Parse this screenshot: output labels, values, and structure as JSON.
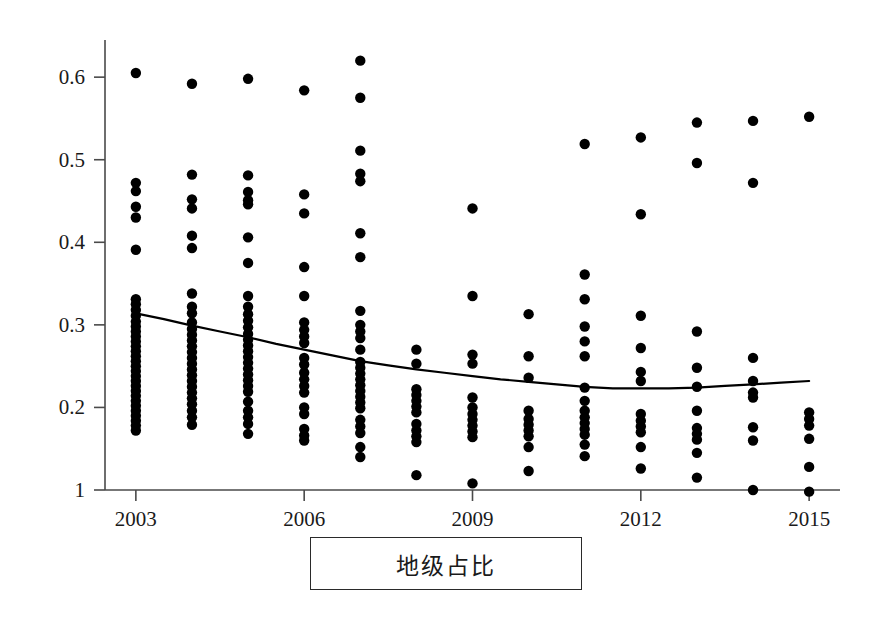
{
  "caption": {
    "label": "地级占比"
  },
  "style": {
    "point_color": "#000000",
    "line_color": "#000000",
    "axis_color": "#4a4a4a",
    "background": "#ffffff",
    "point_radius": 5.2,
    "line_width": 2.2,
    "axis_width": 1.6
  },
  "chart_data": {
    "type": "scatter",
    "title": "",
    "subtitle": "",
    "xlabel": "",
    "ylabel": "",
    "legend": [],
    "grid": false,
    "xlim": [
      2002.45,
      2015.55
    ],
    "ylim": [
      0.1,
      0.645
    ],
    "xticks": [
      2003,
      2006,
      2009,
      2012,
      2015
    ],
    "xticklabels": [
      "2003",
      "2006",
      "2009",
      "2012",
      "2015"
    ],
    "yticks": [
      0.1,
      0.2,
      0.3,
      0.4,
      0.5,
      0.6
    ],
    "yticklabels": [
      "1",
      "0.2",
      "0.3",
      "0.4",
      "0.5",
      "0.6"
    ],
    "series": [
      {
        "name": "地级占比",
        "type": "scatter",
        "marker": "filled-circle",
        "color": "#000000",
        "points": [
          {
            "x": 2003,
            "y": 0.605
          },
          {
            "x": 2003,
            "y": 0.472
          },
          {
            "x": 2003,
            "y": 0.462
          },
          {
            "x": 2003,
            "y": 0.443
          },
          {
            "x": 2003,
            "y": 0.43
          },
          {
            "x": 2003,
            "y": 0.391
          },
          {
            "x": 2003,
            "y": 0.331
          },
          {
            "x": 2003,
            "y": 0.325
          },
          {
            "x": 2003,
            "y": 0.318
          },
          {
            "x": 2003,
            "y": 0.311
          },
          {
            "x": 2003,
            "y": 0.304
          },
          {
            "x": 2003,
            "y": 0.298
          },
          {
            "x": 2003,
            "y": 0.292
          },
          {
            "x": 2003,
            "y": 0.286
          },
          {
            "x": 2003,
            "y": 0.28
          },
          {
            "x": 2003,
            "y": 0.274
          },
          {
            "x": 2003,
            "y": 0.268
          },
          {
            "x": 2003,
            "y": 0.262
          },
          {
            "x": 2003,
            "y": 0.256
          },
          {
            "x": 2003,
            "y": 0.25
          },
          {
            "x": 2003,
            "y": 0.244
          },
          {
            "x": 2003,
            "y": 0.238
          },
          {
            "x": 2003,
            "y": 0.232
          },
          {
            "x": 2003,
            "y": 0.226
          },
          {
            "x": 2003,
            "y": 0.22
          },
          {
            "x": 2003,
            "y": 0.214
          },
          {
            "x": 2003,
            "y": 0.208
          },
          {
            "x": 2003,
            "y": 0.202
          },
          {
            "x": 2003,
            "y": 0.196
          },
          {
            "x": 2003,
            "y": 0.19
          },
          {
            "x": 2003,
            "y": 0.184
          },
          {
            "x": 2003,
            "y": 0.178
          },
          {
            "x": 2003,
            "y": 0.172
          },
          {
            "x": 2004,
            "y": 0.592
          },
          {
            "x": 2004,
            "y": 0.482
          },
          {
            "x": 2004,
            "y": 0.452
          },
          {
            "x": 2004,
            "y": 0.441
          },
          {
            "x": 2004,
            "y": 0.408
          },
          {
            "x": 2004,
            "y": 0.393
          },
          {
            "x": 2004,
            "y": 0.338
          },
          {
            "x": 2004,
            "y": 0.322
          },
          {
            "x": 2004,
            "y": 0.314
          },
          {
            "x": 2004,
            "y": 0.303
          },
          {
            "x": 2004,
            "y": 0.295
          },
          {
            "x": 2004,
            "y": 0.288
          },
          {
            "x": 2004,
            "y": 0.281
          },
          {
            "x": 2004,
            "y": 0.274
          },
          {
            "x": 2004,
            "y": 0.267
          },
          {
            "x": 2004,
            "y": 0.26
          },
          {
            "x": 2004,
            "y": 0.253
          },
          {
            "x": 2004,
            "y": 0.246
          },
          {
            "x": 2004,
            "y": 0.239
          },
          {
            "x": 2004,
            "y": 0.232
          },
          {
            "x": 2004,
            "y": 0.225
          },
          {
            "x": 2004,
            "y": 0.218
          },
          {
            "x": 2004,
            "y": 0.211
          },
          {
            "x": 2004,
            "y": 0.204
          },
          {
            "x": 2004,
            "y": 0.196
          },
          {
            "x": 2004,
            "y": 0.188
          },
          {
            "x": 2004,
            "y": 0.179
          },
          {
            "x": 2005,
            "y": 0.598
          },
          {
            "x": 2005,
            "y": 0.481
          },
          {
            "x": 2005,
            "y": 0.461
          },
          {
            "x": 2005,
            "y": 0.451
          },
          {
            "x": 2005,
            "y": 0.446
          },
          {
            "x": 2005,
            "y": 0.406
          },
          {
            "x": 2005,
            "y": 0.375
          },
          {
            "x": 2005,
            "y": 0.335
          },
          {
            "x": 2005,
            "y": 0.322
          },
          {
            "x": 2005,
            "y": 0.313
          },
          {
            "x": 2005,
            "y": 0.305
          },
          {
            "x": 2005,
            "y": 0.297
          },
          {
            "x": 2005,
            "y": 0.289
          },
          {
            "x": 2005,
            "y": 0.282
          },
          {
            "x": 2005,
            "y": 0.275
          },
          {
            "x": 2005,
            "y": 0.268
          },
          {
            "x": 2005,
            "y": 0.261
          },
          {
            "x": 2005,
            "y": 0.254
          },
          {
            "x": 2005,
            "y": 0.247
          },
          {
            "x": 2005,
            "y": 0.24
          },
          {
            "x": 2005,
            "y": 0.233
          },
          {
            "x": 2005,
            "y": 0.226
          },
          {
            "x": 2005,
            "y": 0.219
          },
          {
            "x": 2005,
            "y": 0.207
          },
          {
            "x": 2005,
            "y": 0.196
          },
          {
            "x": 2005,
            "y": 0.188
          },
          {
            "x": 2005,
            "y": 0.18
          },
          {
            "x": 2005,
            "y": 0.168
          },
          {
            "x": 2006,
            "y": 0.584
          },
          {
            "x": 2006,
            "y": 0.458
          },
          {
            "x": 2006,
            "y": 0.435
          },
          {
            "x": 2006,
            "y": 0.37
          },
          {
            "x": 2006,
            "y": 0.335
          },
          {
            "x": 2006,
            "y": 0.303
          },
          {
            "x": 2006,
            "y": 0.294
          },
          {
            "x": 2006,
            "y": 0.286
          },
          {
            "x": 2006,
            "y": 0.278
          },
          {
            "x": 2006,
            "y": 0.26
          },
          {
            "x": 2006,
            "y": 0.252
          },
          {
            "x": 2006,
            "y": 0.242
          },
          {
            "x": 2006,
            "y": 0.234
          },
          {
            "x": 2006,
            "y": 0.226
          },
          {
            "x": 2006,
            "y": 0.218
          },
          {
            "x": 2006,
            "y": 0.2
          },
          {
            "x": 2006,
            "y": 0.192
          },
          {
            "x": 2006,
            "y": 0.174
          },
          {
            "x": 2006,
            "y": 0.166
          },
          {
            "x": 2006,
            "y": 0.16
          },
          {
            "x": 2007,
            "y": 0.62
          },
          {
            "x": 2007,
            "y": 0.575
          },
          {
            "x": 2007,
            "y": 0.511
          },
          {
            "x": 2007,
            "y": 0.483
          },
          {
            "x": 2007,
            "y": 0.474
          },
          {
            "x": 2007,
            "y": 0.411
          },
          {
            "x": 2007,
            "y": 0.382
          },
          {
            "x": 2007,
            "y": 0.317
          },
          {
            "x": 2007,
            "y": 0.3
          },
          {
            "x": 2007,
            "y": 0.292
          },
          {
            "x": 2007,
            "y": 0.284
          },
          {
            "x": 2007,
            "y": 0.27
          },
          {
            "x": 2007,
            "y": 0.255
          },
          {
            "x": 2007,
            "y": 0.248
          },
          {
            "x": 2007,
            "y": 0.241
          },
          {
            "x": 2007,
            "y": 0.234
          },
          {
            "x": 2007,
            "y": 0.227
          },
          {
            "x": 2007,
            "y": 0.22
          },
          {
            "x": 2007,
            "y": 0.213
          },
          {
            "x": 2007,
            "y": 0.206
          },
          {
            "x": 2007,
            "y": 0.199
          },
          {
            "x": 2007,
            "y": 0.185
          },
          {
            "x": 2007,
            "y": 0.177
          },
          {
            "x": 2007,
            "y": 0.169
          },
          {
            "x": 2007,
            "y": 0.152
          },
          {
            "x": 2007,
            "y": 0.14
          },
          {
            "x": 2008,
            "y": 0.27
          },
          {
            "x": 2008,
            "y": 0.253
          },
          {
            "x": 2008,
            "y": 0.222
          },
          {
            "x": 2008,
            "y": 0.215
          },
          {
            "x": 2008,
            "y": 0.208
          },
          {
            "x": 2008,
            "y": 0.201
          },
          {
            "x": 2008,
            "y": 0.194
          },
          {
            "x": 2008,
            "y": 0.18
          },
          {
            "x": 2008,
            "y": 0.172
          },
          {
            "x": 2008,
            "y": 0.165
          },
          {
            "x": 2008,
            "y": 0.158
          },
          {
            "x": 2008,
            "y": 0.118
          },
          {
            "x": 2009,
            "y": 0.441
          },
          {
            "x": 2009,
            "y": 0.335
          },
          {
            "x": 2009,
            "y": 0.264
          },
          {
            "x": 2009,
            "y": 0.253
          },
          {
            "x": 2009,
            "y": 0.212
          },
          {
            "x": 2009,
            "y": 0.2
          },
          {
            "x": 2009,
            "y": 0.192
          },
          {
            "x": 2009,
            "y": 0.185
          },
          {
            "x": 2009,
            "y": 0.178
          },
          {
            "x": 2009,
            "y": 0.171
          },
          {
            "x": 2009,
            "y": 0.164
          },
          {
            "x": 2009,
            "y": 0.108
          },
          {
            "x": 2010,
            "y": 0.313
          },
          {
            "x": 2010,
            "y": 0.262
          },
          {
            "x": 2010,
            "y": 0.236
          },
          {
            "x": 2010,
            "y": 0.196
          },
          {
            "x": 2010,
            "y": 0.186
          },
          {
            "x": 2010,
            "y": 0.179
          },
          {
            "x": 2010,
            "y": 0.172
          },
          {
            "x": 2010,
            "y": 0.165
          },
          {
            "x": 2010,
            "y": 0.152
          },
          {
            "x": 2010,
            "y": 0.123
          },
          {
            "x": 2011,
            "y": 0.519
          },
          {
            "x": 2011,
            "y": 0.361
          },
          {
            "x": 2011,
            "y": 0.331
          },
          {
            "x": 2011,
            "y": 0.298
          },
          {
            "x": 2011,
            "y": 0.28
          },
          {
            "x": 2011,
            "y": 0.262
          },
          {
            "x": 2011,
            "y": 0.224
          },
          {
            "x": 2011,
            "y": 0.208
          },
          {
            "x": 2011,
            "y": 0.196
          },
          {
            "x": 2011,
            "y": 0.188
          },
          {
            "x": 2011,
            "y": 0.181
          },
          {
            "x": 2011,
            "y": 0.174
          },
          {
            "x": 2011,
            "y": 0.167
          },
          {
            "x": 2011,
            "y": 0.155
          },
          {
            "x": 2011,
            "y": 0.141
          },
          {
            "x": 2012,
            "y": 0.527
          },
          {
            "x": 2012,
            "y": 0.434
          },
          {
            "x": 2012,
            "y": 0.311
          },
          {
            "x": 2012,
            "y": 0.272
          },
          {
            "x": 2012,
            "y": 0.243
          },
          {
            "x": 2012,
            "y": 0.232
          },
          {
            "x": 2012,
            "y": 0.192
          },
          {
            "x": 2012,
            "y": 0.184
          },
          {
            "x": 2012,
            "y": 0.177
          },
          {
            "x": 2012,
            "y": 0.17
          },
          {
            "x": 2012,
            "y": 0.152
          },
          {
            "x": 2012,
            "y": 0.126
          },
          {
            "x": 2013,
            "y": 0.545
          },
          {
            "x": 2013,
            "y": 0.496
          },
          {
            "x": 2013,
            "y": 0.292
          },
          {
            "x": 2013,
            "y": 0.248
          },
          {
            "x": 2013,
            "y": 0.225
          },
          {
            "x": 2013,
            "y": 0.196
          },
          {
            "x": 2013,
            "y": 0.175
          },
          {
            "x": 2013,
            "y": 0.168
          },
          {
            "x": 2013,
            "y": 0.161
          },
          {
            "x": 2013,
            "y": 0.145
          },
          {
            "x": 2013,
            "y": 0.115
          },
          {
            "x": 2014,
            "y": 0.547
          },
          {
            "x": 2014,
            "y": 0.472
          },
          {
            "x": 2014,
            "y": 0.26
          },
          {
            "x": 2014,
            "y": 0.232
          },
          {
            "x": 2014,
            "y": 0.218
          },
          {
            "x": 2014,
            "y": 0.212
          },
          {
            "x": 2014,
            "y": 0.176
          },
          {
            "x": 2014,
            "y": 0.16
          },
          {
            "x": 2014,
            "y": 0.1
          },
          {
            "x": 2015,
            "y": 0.552
          },
          {
            "x": 2015,
            "y": 0.194
          },
          {
            "x": 2015,
            "y": 0.186
          },
          {
            "x": 2015,
            "y": 0.178
          },
          {
            "x": 2015,
            "y": 0.162
          },
          {
            "x": 2015,
            "y": 0.128
          },
          {
            "x": 2015,
            "y": 0.098
          }
        ]
      },
      {
        "name": "trend",
        "type": "line",
        "color": "#000000",
        "points": [
          {
            "x": 2003.0,
            "y": 0.314
          },
          {
            "x": 2003.5,
            "y": 0.307
          },
          {
            "x": 2004.0,
            "y": 0.299
          },
          {
            "x": 2004.5,
            "y": 0.292
          },
          {
            "x": 2005.0,
            "y": 0.285
          },
          {
            "x": 2005.5,
            "y": 0.277
          },
          {
            "x": 2006.0,
            "y": 0.27
          },
          {
            "x": 2006.5,
            "y": 0.263
          },
          {
            "x": 2007.0,
            "y": 0.256
          },
          {
            "x": 2007.5,
            "y": 0.251
          },
          {
            "x": 2008.0,
            "y": 0.246
          },
          {
            "x": 2008.5,
            "y": 0.242
          },
          {
            "x": 2009.0,
            "y": 0.238
          },
          {
            "x": 2009.5,
            "y": 0.234
          },
          {
            "x": 2010.0,
            "y": 0.231
          },
          {
            "x": 2010.5,
            "y": 0.228
          },
          {
            "x": 2011.0,
            "y": 0.225
          },
          {
            "x": 2011.5,
            "y": 0.223
          },
          {
            "x": 2012.0,
            "y": 0.223
          },
          {
            "x": 2012.5,
            "y": 0.223
          },
          {
            "x": 2013.0,
            "y": 0.224
          },
          {
            "x": 2013.5,
            "y": 0.226
          },
          {
            "x": 2014.0,
            "y": 0.228
          },
          {
            "x": 2014.5,
            "y": 0.23
          },
          {
            "x": 2015.0,
            "y": 0.232
          }
        ]
      }
    ]
  }
}
